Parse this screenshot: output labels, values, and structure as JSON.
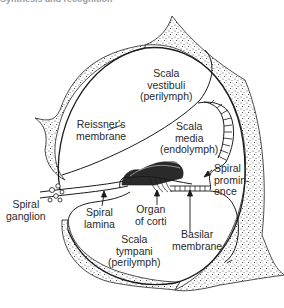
{
  "caption": "Synthesis and recognition",
  "diagram": {
    "type": "anatomical-cross-section",
    "labels": {
      "scala_vestibuli": [
        "Scala",
        "vestibuli",
        "(perilymph)"
      ],
      "reissners_membrane": [
        "Reissner's",
        "membrane"
      ],
      "scala_media": [
        "Scala",
        "media",
        "(endolymph)"
      ],
      "spiral_prominence": [
        "Spiral",
        "promin-",
        "ence"
      ],
      "spiral_ganglion": [
        "Spiral",
        "ganglion"
      ],
      "spiral_lamina": [
        "Spiral",
        "lamina"
      ],
      "organ_of_corti": [
        "Organ",
        "of corti"
      ],
      "basilar_membrane": [
        "Basilar",
        "membrane"
      ],
      "scala_tympani": [
        "Scala",
        "tympani",
        "(perilymph)"
      ]
    },
    "colors": {
      "line": "#1a1a1a",
      "bone_stipple": "#555555",
      "background": "#ffffff"
    }
  }
}
